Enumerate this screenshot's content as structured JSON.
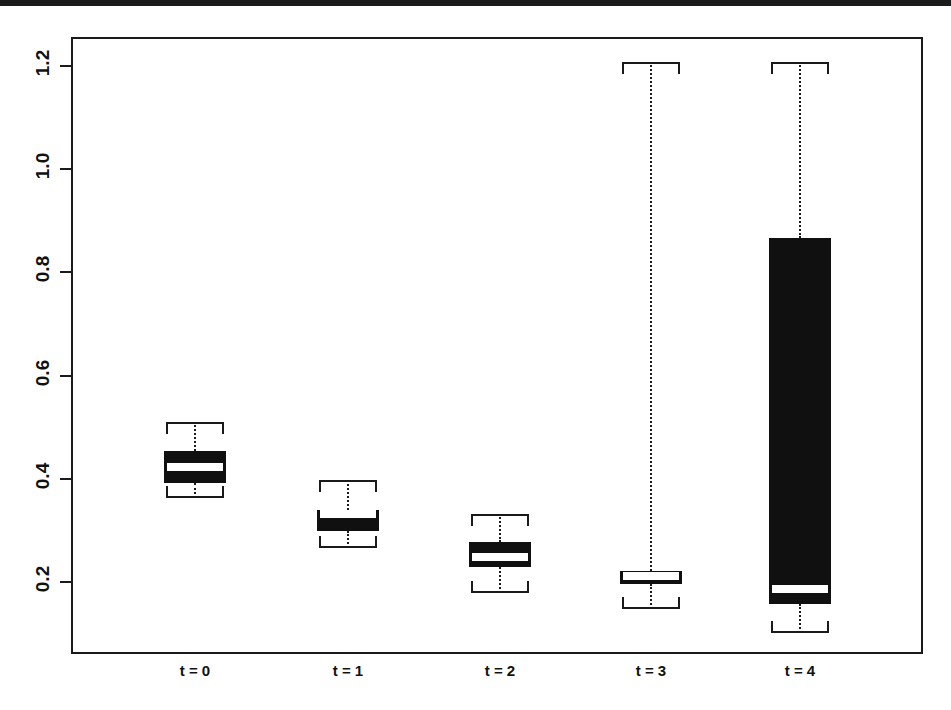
{
  "figure": {
    "kind": "boxplot-figure",
    "background_color": "#ffffff",
    "ink_color": "#111111"
  },
  "chart_data": {
    "type": "box",
    "title": "",
    "subtitle": "",
    "xlabel": "",
    "ylabel": "",
    "grid": false,
    "legend": null,
    "ylim": [
      0.082,
      1.25
    ],
    "yticks": [
      0.2,
      0.4,
      0.6,
      0.8,
      1.0,
      1.2
    ],
    "ytick_labels": [
      "0.2",
      "0.4",
      "0.6",
      "0.8",
      "1.0",
      "1.2"
    ],
    "categories": [
      "t = 0",
      "t = 1",
      "t = 2",
      "t = 3",
      "t = 4"
    ],
    "boxes": [
      {
        "category": "t = 0",
        "whisker_low": 0.363,
        "q1": 0.392,
        "median": 0.423,
        "q3": 0.454,
        "whisker_high": 0.51
      },
      {
        "category": "t = 1",
        "whisker_low": 0.265,
        "q1": 0.299,
        "median": 0.332,
        "q3": 0.34,
        "whisker_high": 0.397
      },
      {
        "category": "t = 2",
        "whisker_low": 0.178,
        "q1": 0.23,
        "median": 0.248,
        "q3": 0.278,
        "whisker_high": 0.331
      },
      {
        "category": "t = 3",
        "whisker_low": 0.147,
        "q1": 0.197,
        "median": 0.212,
        "q3": 0.221,
        "whisker_high": 1.208
      },
      {
        "category": "t = 4",
        "whisker_low": 0.101,
        "q1": 0.158,
        "median": 0.186,
        "q3": 0.867,
        "whisker_high": 1.208
      }
    ]
  }
}
